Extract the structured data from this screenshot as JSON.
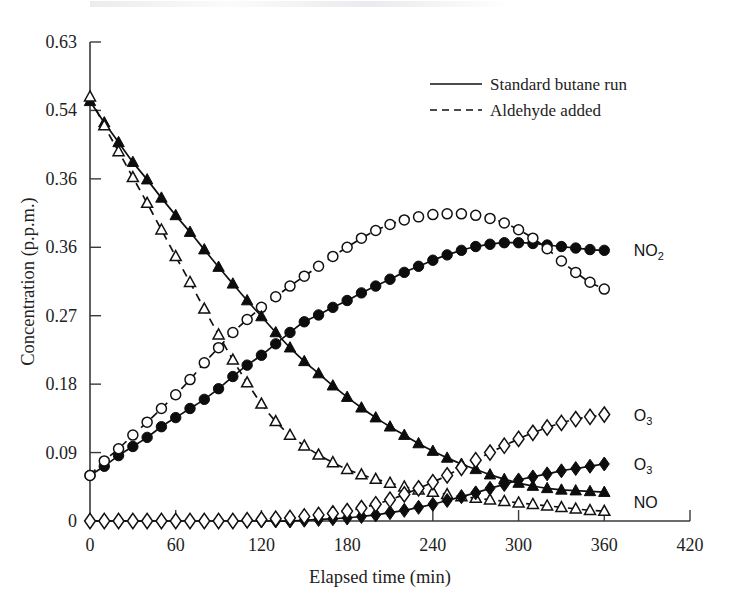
{
  "chart_data": {
    "type": "line",
    "title": "",
    "xlabel": "Elapsed time (min)",
    "ylabel": "Concentration (p.p.m.)",
    "xlim": [
      0,
      420
    ],
    "ylim": [
      0,
      0.63
    ],
    "xticks": [
      "0",
      "60",
      "120",
      "180",
      "240",
      "300",
      "360",
      "420"
    ],
    "xtick_values": [
      0,
      60,
      120,
      180,
      240,
      300,
      360,
      420
    ],
    "yticks": [
      "0",
      "0.09",
      "0.18",
      "0.27",
      "0.36",
      "0.36",
      "0.54",
      "0.63"
    ],
    "ytick_values": [
      0,
      0.09,
      0.18,
      0.27,
      0.36,
      0.45,
      0.54,
      0.63
    ],
    "grid": false,
    "legend_position": "top-right",
    "legend": [
      {
        "label": "Standard butane run",
        "style": "solid"
      },
      {
        "label": "Aldehyde added",
        "style": "dashed"
      }
    ],
    "series": [
      {
        "name": "NO2 standard butane run",
        "label": "NO2",
        "line": "solid",
        "marker": "filled-circle",
        "x": [
          0,
          10,
          20,
          30,
          40,
          50,
          60,
          70,
          80,
          90,
          100,
          110,
          120,
          130,
          140,
          150,
          160,
          170,
          180,
          190,
          200,
          210,
          220,
          230,
          240,
          250,
          260,
          270,
          280,
          290,
          300,
          310,
          320,
          330,
          340,
          350,
          360
        ],
        "y": [
          0.06,
          0.072,
          0.086,
          0.098,
          0.11,
          0.124,
          0.136,
          0.148,
          0.16,
          0.174,
          0.19,
          0.205,
          0.218,
          0.233,
          0.248,
          0.262,
          0.271,
          0.281,
          0.29,
          0.3,
          0.309,
          0.318,
          0.327,
          0.335,
          0.343,
          0.35,
          0.356,
          0.361,
          0.364,
          0.366,
          0.366,
          0.365,
          0.363,
          0.361,
          0.359,
          0.357,
          0.356
        ]
      },
      {
        "name": "NO2 aldehyde added",
        "label": "NO2",
        "line": "dashed",
        "marker": "open-circle",
        "x": [
          0,
          10,
          20,
          30,
          40,
          50,
          60,
          70,
          80,
          90,
          100,
          110,
          120,
          130,
          140,
          150,
          160,
          170,
          180,
          190,
          200,
          210,
          220,
          230,
          240,
          250,
          260,
          270,
          280,
          290,
          300,
          310,
          320,
          330,
          340,
          350,
          360
        ],
        "y": [
          0.06,
          0.079,
          0.095,
          0.113,
          0.13,
          0.148,
          0.166,
          0.186,
          0.208,
          0.228,
          0.248,
          0.265,
          0.281,
          0.295,
          0.309,
          0.322,
          0.335,
          0.348,
          0.36,
          0.372,
          0.382,
          0.39,
          0.396,
          0.4,
          0.403,
          0.404,
          0.404,
          0.402,
          0.398,
          0.392,
          0.383,
          0.372,
          0.358,
          0.342,
          0.327,
          0.314,
          0.305
        ]
      },
      {
        "name": "NO standard butane run",
        "label": "NO",
        "line": "solid",
        "marker": "filled-triangle",
        "x": [
          0,
          10,
          20,
          30,
          40,
          50,
          60,
          70,
          80,
          90,
          100,
          110,
          120,
          130,
          140,
          150,
          160,
          170,
          180,
          190,
          200,
          210,
          220,
          230,
          240,
          250,
          260,
          270,
          280,
          290,
          300,
          310,
          320,
          330,
          340,
          350,
          360
        ],
        "y": [
          0.552,
          0.524,
          0.498,
          0.472,
          0.449,
          0.425,
          0.402,
          0.38,
          0.357,
          0.334,
          0.312,
          0.29,
          0.269,
          0.248,
          0.228,
          0.21,
          0.194,
          0.178,
          0.163,
          0.149,
          0.136,
          0.124,
          0.113,
          0.102,
          0.092,
          0.083,
          0.075,
          0.068,
          0.061,
          0.055,
          0.05,
          0.046,
          0.043,
          0.041,
          0.04,
          0.039,
          0.038
        ]
      },
      {
        "name": "NO aldehyde added",
        "label": "NO",
        "line": "dashed",
        "marker": "open-triangle",
        "x": [
          0,
          10,
          20,
          30,
          40,
          50,
          60,
          70,
          80,
          90,
          100,
          110,
          120,
          130,
          140,
          150,
          160,
          170,
          180,
          190,
          200,
          210,
          220,
          230,
          240,
          250,
          260,
          270,
          280,
          290,
          300,
          310,
          320,
          330,
          340,
          350,
          360
        ],
        "y": [
          0.558,
          0.52,
          0.486,
          0.452,
          0.418,
          0.383,
          0.348,
          0.314,
          0.279,
          0.245,
          0.212,
          0.182,
          0.154,
          0.131,
          0.113,
          0.099,
          0.087,
          0.077,
          0.068,
          0.061,
          0.055,
          0.05,
          0.045,
          0.041,
          0.038,
          0.035,
          0.032,
          0.03,
          0.028,
          0.026,
          0.024,
          0.022,
          0.02,
          0.018,
          0.016,
          0.014,
          0.013
        ]
      },
      {
        "name": "O3 standard butane run",
        "label": "O3",
        "line": "solid",
        "marker": "filled-diamond",
        "x": [
          0,
          10,
          20,
          30,
          40,
          50,
          60,
          70,
          80,
          90,
          100,
          110,
          120,
          130,
          140,
          150,
          160,
          170,
          180,
          190,
          200,
          210,
          220,
          230,
          240,
          250,
          260,
          270,
          280,
          290,
          300,
          310,
          320,
          330,
          340,
          350,
          360
        ],
        "y": [
          0.0,
          0.0,
          0.0,
          0.0,
          0.0,
          0.0,
          0.0,
          0.0,
          0.0,
          0.0,
          0.0,
          0.0,
          0.0,
          0.0,
          0.0,
          0.001,
          0.002,
          0.003,
          0.004,
          0.006,
          0.008,
          0.011,
          0.014,
          0.018,
          0.022,
          0.027,
          0.032,
          0.037,
          0.043,
          0.048,
          0.054,
          0.058,
          0.062,
          0.066,
          0.069,
          0.072,
          0.075
        ]
      },
      {
        "name": "O3 aldehyde added",
        "label": "O3",
        "line": "dashed",
        "marker": "open-diamond",
        "x": [
          0,
          10,
          20,
          30,
          40,
          50,
          60,
          70,
          80,
          90,
          100,
          110,
          120,
          130,
          140,
          150,
          160,
          170,
          180,
          190,
          200,
          210,
          220,
          230,
          240,
          250,
          260,
          270,
          280,
          290,
          300,
          310,
          320,
          330,
          340,
          350,
          360
        ],
        "y": [
          0.0,
          0.0,
          0.0,
          0.0,
          0.0,
          0.0,
          0.0,
          0.0,
          0.0,
          0.0,
          0.0,
          0.001,
          0.002,
          0.003,
          0.004,
          0.006,
          0.008,
          0.01,
          0.013,
          0.017,
          0.022,
          0.028,
          0.035,
          0.043,
          0.051,
          0.06,
          0.07,
          0.08,
          0.09,
          0.099,
          0.108,
          0.116,
          0.123,
          0.129,
          0.134,
          0.137,
          0.14
        ]
      }
    ],
    "annotations": [
      {
        "text": "NO2",
        "base": "NO",
        "sub": "2",
        "at_x": 375,
        "at_y": 0.356
      },
      {
        "text": "O3",
        "base": "O",
        "sub": "3",
        "at_x": 375,
        "at_y": 0.14
      },
      {
        "text": "O3",
        "base": "O",
        "sub": "3",
        "at_x": 375,
        "at_y": 0.075
      },
      {
        "text": "NO",
        "base": "NO",
        "sub": "",
        "at_x": 375,
        "at_y": 0.025
      }
    ]
  }
}
